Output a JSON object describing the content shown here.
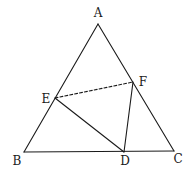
{
  "diagram": {
    "type": "geometry",
    "stroke_color": "#1a1a1a",
    "background": "#ffffff",
    "points": {
      "A": {
        "x": 98,
        "y": 24
      },
      "B": {
        "x": 24,
        "y": 152
      },
      "C": {
        "x": 174,
        "y": 151
      },
      "D": {
        "x": 124,
        "y": 152
      },
      "E": {
        "x": 55,
        "y": 98
      },
      "F": {
        "x": 133,
        "y": 82
      }
    },
    "labels": {
      "A": {
        "text": "A",
        "x": 98,
        "y": 13
      },
      "B": {
        "text": "B",
        "x": 17,
        "y": 161
      },
      "C": {
        "text": "C",
        "x": 178,
        "y": 159
      },
      "D": {
        "text": "D",
        "x": 125,
        "y": 161
      },
      "E": {
        "text": "E",
        "x": 46,
        "y": 99
      },
      "F": {
        "text": "F",
        "x": 143,
        "y": 82
      }
    },
    "segments": [
      {
        "from": "A",
        "to": "B",
        "style": "solid"
      },
      {
        "from": "A",
        "to": "C",
        "style": "solid"
      },
      {
        "from": "B",
        "to": "C",
        "style": "solid"
      },
      {
        "from": "E",
        "to": "D",
        "style": "solid"
      },
      {
        "from": "F",
        "to": "D",
        "style": "solid"
      },
      {
        "from": "E",
        "to": "F",
        "style": "dashed"
      }
    ]
  }
}
